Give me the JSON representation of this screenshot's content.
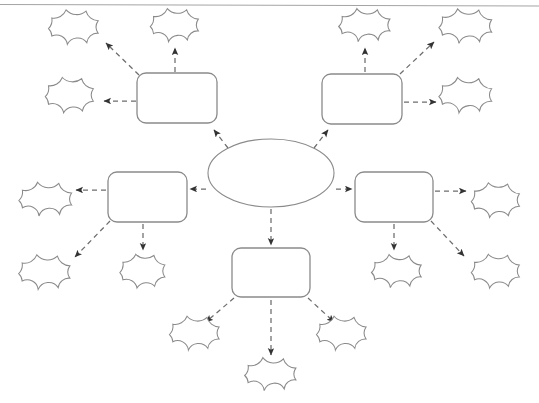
{
  "document": {
    "title": "Concept Map Template",
    "description": "Blank graphic organizer worksheet: one central oval, five rounded rectangles, fifteen cloud shapes, joined by dashed arrows.",
    "background_color": "#ffffff",
    "outline_color": "#8a8a8a",
    "connector_color": "#6d6d6d",
    "canvas": {
      "width": 539,
      "height": 403
    }
  },
  "rule": {
    "name": "top-horizontal-rule",
    "x1": 0,
    "y1": 4,
    "x2": 539,
    "y2": 6,
    "color": "#9a9a9a"
  },
  "center": {
    "id": "center-oval",
    "label": "",
    "cx": 271,
    "cy": 173,
    "rx": 63,
    "ry": 34
  },
  "boxes": [
    {
      "id": "box-top-left",
      "label": "",
      "x": 137,
      "y": 73,
      "w": 80,
      "h": 50,
      "r": 9
    },
    {
      "id": "box-top-right",
      "label": "",
      "x": 322,
      "y": 74,
      "w": 80,
      "h": 50,
      "r": 9
    },
    {
      "id": "box-middle-left",
      "label": "",
      "x": 108,
      "y": 172,
      "w": 79,
      "h": 50,
      "r": 9
    },
    {
      "id": "box-middle-right",
      "label": "",
      "x": 355,
      "y": 172,
      "w": 78,
      "h": 50,
      "r": 9
    },
    {
      "id": "box-bottom",
      "label": "",
      "x": 232,
      "y": 248,
      "w": 78,
      "h": 49,
      "r": 9
    }
  ],
  "clouds": [
    {
      "id": "cloud-tl-upper-left",
      "label": "",
      "cx": 74,
      "cy": 27,
      "w": 64,
      "h": 45
    },
    {
      "id": "cloud-tl-upper-right",
      "label": "",
      "cx": 175,
      "cy": 25,
      "w": 62,
      "h": 43
    },
    {
      "id": "cloud-tl-side",
      "label": "",
      "cx": 70,
      "cy": 95,
      "w": 62,
      "h": 46
    },
    {
      "id": "cloud-tr-upper-left",
      "label": "",
      "cx": 365,
      "cy": 25,
      "w": 66,
      "h": 43
    },
    {
      "id": "cloud-tr-upper-right",
      "label": "",
      "cx": 466,
      "cy": 26,
      "w": 68,
      "h": 45
    },
    {
      "id": "cloud-tr-side",
      "label": "",
      "cx": 466,
      "cy": 95,
      "w": 68,
      "h": 46
    },
    {
      "id": "cloud-ml-side",
      "label": "",
      "cx": 46,
      "cy": 199,
      "w": 68,
      "h": 44
    },
    {
      "id": "cloud-ml-lower-left",
      "label": "",
      "cx": 45,
      "cy": 272,
      "w": 66,
      "h": 45
    },
    {
      "id": "cloud-ml-lower-right",
      "label": "",
      "cx": 143,
      "cy": 271,
      "w": 58,
      "h": 44
    },
    {
      "id": "cloud-mr-side",
      "label": "",
      "cx": 496,
      "cy": 200,
      "w": 62,
      "h": 45
    },
    {
      "id": "cloud-mr-lower-left",
      "label": "",
      "cx": 397,
      "cy": 271,
      "w": 64,
      "h": 43
    },
    {
      "id": "cloud-mr-lower-right",
      "label": "",
      "cx": 496,
      "cy": 271,
      "w": 62,
      "h": 44
    },
    {
      "id": "cloud-bottom-left",
      "label": "",
      "cx": 195,
      "cy": 333,
      "w": 64,
      "h": 44
    },
    {
      "id": "cloud-bottom-center",
      "label": "",
      "cx": 271,
      "cy": 374,
      "w": 66,
      "h": 43
    },
    {
      "id": "cloud-bottom-right",
      "label": "",
      "cx": 342,
      "cy": 333,
      "w": 64,
      "h": 44
    }
  ],
  "connectors": [
    {
      "id": "arrow-center-to-box-top-left",
      "from": "center-oval",
      "to": "box-top-left",
      "x1": 228,
      "y1": 148,
      "x2": 214,
      "y2": 130
    },
    {
      "id": "arrow-center-to-box-top-right",
      "from": "center-oval",
      "to": "box-top-right",
      "x1": 314,
      "y1": 148,
      "x2": 328,
      "y2": 130
    },
    {
      "id": "arrow-center-to-box-middle-left",
      "from": "center-oval",
      "to": "box-middle-left",
      "x1": 206,
      "y1": 189,
      "x2": 190,
      "y2": 189
    },
    {
      "id": "arrow-center-to-box-middle-right",
      "from": "center-oval",
      "to": "box-middle-right",
      "x1": 336,
      "y1": 189,
      "x2": 352,
      "y2": 189
    },
    {
      "id": "arrow-center-to-box-bottom",
      "from": "center-oval",
      "to": "box-bottom",
      "x1": 271,
      "y1": 209,
      "x2": 271,
      "y2": 245
    },
    {
      "id": "arrow-box-top-left-to-cloud-1",
      "from": "box-top-left",
      "to": "cloud-tl-upper-left",
      "x1": 139,
      "y1": 75,
      "x2": 106,
      "y2": 43
    },
    {
      "id": "arrow-box-top-left-to-cloud-2",
      "from": "box-top-left",
      "to": "cloud-tl-upper-right",
      "x1": 175,
      "y1": 72,
      "x2": 175,
      "y2": 48
    },
    {
      "id": "arrow-box-top-left-to-cloud-3",
      "from": "box-top-left",
      "to": "cloud-tl-side",
      "x1": 136,
      "y1": 101,
      "x2": 104,
      "y2": 101
    },
    {
      "id": "arrow-box-top-right-to-cloud-4",
      "from": "box-top-right",
      "to": "cloud-tr-upper-left",
      "x1": 365,
      "y1": 72,
      "x2": 365,
      "y2": 48
    },
    {
      "id": "arrow-box-top-right-to-cloud-5",
      "from": "box-top-right",
      "to": "cloud-tr-upper-right",
      "x1": 400,
      "y1": 74,
      "x2": 434,
      "y2": 42
    },
    {
      "id": "arrow-box-top-right-to-cloud-6",
      "from": "box-top-right",
      "to": "cloud-tr-side",
      "x1": 404,
      "y1": 102,
      "x2": 436,
      "y2": 102
    },
    {
      "id": "arrow-box-middle-left-to-cloud-7",
      "from": "box-middle-left",
      "to": "cloud-ml-side",
      "x1": 106,
      "y1": 190,
      "x2": 76,
      "y2": 190
    },
    {
      "id": "arrow-box-middle-left-to-cloud-8",
      "from": "box-middle-left",
      "to": "cloud-ml-lower-left",
      "x1": 110,
      "y1": 221,
      "x2": 75,
      "y2": 257
    },
    {
      "id": "arrow-box-middle-left-to-cloud-9",
      "from": "box-middle-left",
      "to": "cloud-ml-lower-right",
      "x1": 143,
      "y1": 224,
      "x2": 143,
      "y2": 250
    },
    {
      "id": "arrow-box-middle-right-to-cloud-10",
      "from": "box-middle-right",
      "to": "cloud-mr-side",
      "x1": 435,
      "y1": 191,
      "x2": 466,
      "y2": 191
    },
    {
      "id": "arrow-box-middle-right-to-cloud-11",
      "from": "box-middle-right",
      "to": "cloud-mr-lower-left",
      "x1": 394,
      "y1": 224,
      "x2": 394,
      "y2": 250
    },
    {
      "id": "arrow-box-middle-right-to-cloud-12",
      "from": "box-middle-right",
      "to": "cloud-mr-lower-right",
      "x1": 431,
      "y1": 221,
      "x2": 464,
      "y2": 256
    },
    {
      "id": "arrow-box-bottom-to-cloud-13",
      "from": "box-bottom",
      "to": "cloud-bottom-left",
      "x1": 234,
      "y1": 298,
      "x2": 206,
      "y2": 322
    },
    {
      "id": "arrow-box-bottom-to-cloud-14",
      "from": "box-bottom",
      "to": "cloud-bottom-center",
      "x1": 271,
      "y1": 300,
      "x2": 271,
      "y2": 355
    },
    {
      "id": "arrow-box-bottom-to-cloud-15",
      "from": "box-bottom",
      "to": "cloud-bottom-right",
      "x1": 308,
      "y1": 298,
      "x2": 334,
      "y2": 322
    }
  ]
}
